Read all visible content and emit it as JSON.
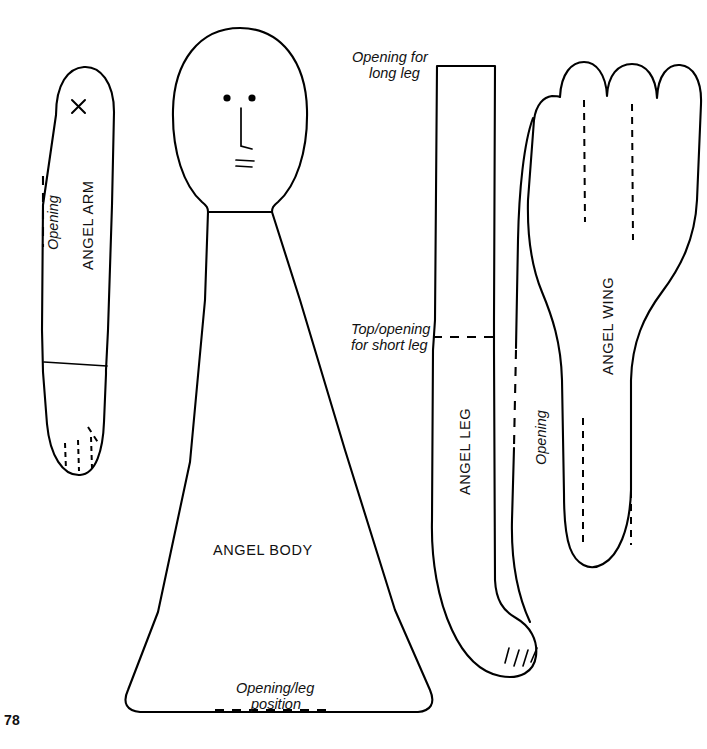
{
  "page": {
    "number": "78",
    "background_color": "#ffffff",
    "ink_color": "#000000"
  },
  "pieces": [
    {
      "id": "angel-arm",
      "label": "ANGEL ARM",
      "markings": [
        {
          "name": "opening",
          "label": "Opening",
          "style": "dashed"
        },
        {
          "name": "placement-x",
          "label": "X",
          "style": "cross-mark"
        },
        {
          "name": "wrist-line",
          "label": "",
          "style": "solid"
        },
        {
          "name": "finger-lines",
          "label": "",
          "style": "dashed"
        }
      ]
    },
    {
      "id": "angel-body",
      "label": "ANGEL BODY",
      "markings": [
        {
          "name": "bottom-opening",
          "label": "Opening/leg position",
          "style": "dashed"
        },
        {
          "name": "shoulder-line",
          "label": "",
          "style": "solid"
        },
        {
          "name": "face-eyes",
          "label": "",
          "style": "dots"
        },
        {
          "name": "face-nose",
          "label": "",
          "style": "solid"
        },
        {
          "name": "face-mouth",
          "label": "",
          "style": "solid"
        }
      ]
    },
    {
      "id": "angel-leg",
      "label": "ANGEL LEG",
      "markings": [
        {
          "name": "long-leg-opening",
          "label": "Opening for long leg",
          "style": "dashed"
        },
        {
          "name": "short-leg-opening",
          "label": "Top/opening for short leg",
          "style": "dashed"
        },
        {
          "name": "side-opening",
          "label": "Opening",
          "style": "dashed"
        },
        {
          "name": "toe-lines",
          "label": "",
          "style": "solid"
        }
      ]
    },
    {
      "id": "angel-wing",
      "label": "ANGEL WING",
      "markings": [
        {
          "name": "feather-lines",
          "label": "",
          "style": "dashed"
        }
      ]
    }
  ],
  "labels": {
    "angel_arm": "ANGEL ARM",
    "angel_body": "ANGEL BODY",
    "angel_leg": "ANGEL LEG",
    "angel_wing": "ANGEL WING",
    "arm_opening": "Opening",
    "arm_mark": "X",
    "body_opening": "Opening/leg position",
    "body_opening_line1": "Opening/leg",
    "body_opening_line2": "position",
    "leg_long_opening_line1": "Opening for",
    "leg_long_opening_line2": "long leg",
    "leg_short_opening_line1": "Top/opening",
    "leg_short_opening_line2": "for short leg",
    "leg_side_opening": "Opening"
  }
}
